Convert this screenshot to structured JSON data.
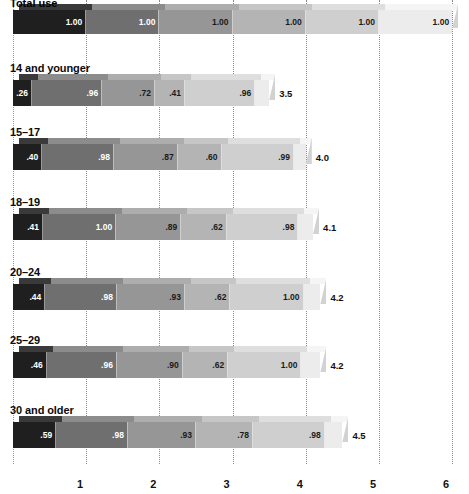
{
  "title": "Total use",
  "chart_data": {
    "type": "bar",
    "orientation": "horizontal",
    "stacked": true,
    "title": "Total use",
    "xlabel": "",
    "ylabel": "",
    "xlim": [
      0,
      6
    ],
    "grid": true,
    "legend": "none",
    "xticks": [
      "1",
      "2",
      "3",
      "4",
      "5",
      "6"
    ],
    "xtick_values": [
      1,
      2,
      3,
      4,
      5,
      6
    ],
    "segment_colors": [
      "#1f1f1f",
      "#6f6f6f",
      "#969696",
      "#b4b4b4",
      "#cfcfcf",
      "#ececec"
    ],
    "categories": [
      "Total use",
      "14 and younger",
      "15–17",
      "18–19",
      "20–24",
      "25–29",
      "30 and older"
    ],
    "rows": [
      {
        "label": "Total use",
        "values": [
          1.0,
          1.0,
          1.0,
          1.0,
          1.0,
          1.0
        ],
        "value_labels": [
          "1.00",
          "1.00",
          "1.00",
          "1.00",
          "1.00",
          "1.00"
        ],
        "total": "",
        "total_value": 6.0
      },
      {
        "label": "14 and younger",
        "values": [
          0.26,
          0.96,
          0.72,
          0.41,
          0.96,
          0.19
        ],
        "value_labels": [
          ".26",
          ".96",
          ".72",
          ".41",
          ".96",
          ""
        ],
        "total": "3.5",
        "total_value": 3.5
      },
      {
        "label": "15–17",
        "values": [
          0.4,
          0.98,
          0.87,
          0.6,
          0.99,
          0.16
        ],
        "value_labels": [
          ".40",
          ".98",
          ".87",
          ".60",
          ".99",
          ""
        ],
        "total": "4.0",
        "total_value": 4.0
      },
      {
        "label": "18–19",
        "values": [
          0.41,
          1.0,
          0.89,
          0.62,
          0.98,
          0.2
        ],
        "value_labels": [
          ".41",
          "1.00",
          ".89",
          ".62",
          ".98",
          ""
        ],
        "total": "4.1",
        "total_value": 4.1
      },
      {
        "label": "20–24",
        "values": [
          0.44,
          0.98,
          0.93,
          0.62,
          1.0,
          0.23
        ],
        "value_labels": [
          ".44",
          ".98",
          ".93",
          ".62",
          "1.00",
          ""
        ],
        "total": "4.2",
        "total_value": 4.2
      },
      {
        "label": "25–29",
        "values": [
          0.46,
          0.96,
          0.9,
          0.62,
          1.0,
          0.26
        ],
        "value_labels": [
          ".46",
          ".96",
          ".90",
          ".62",
          "1.00",
          ""
        ],
        "total": "4.2",
        "total_value": 4.2
      },
      {
        "label": "30 and older",
        "values": [
          0.59,
          0.98,
          0.93,
          0.78,
          0.98,
          0.24
        ],
        "value_labels": [
          ".59",
          ".98",
          ".93",
          ".78",
          ".98",
          ""
        ],
        "total": "4.5",
        "total_value": 4.5
      }
    ]
  }
}
